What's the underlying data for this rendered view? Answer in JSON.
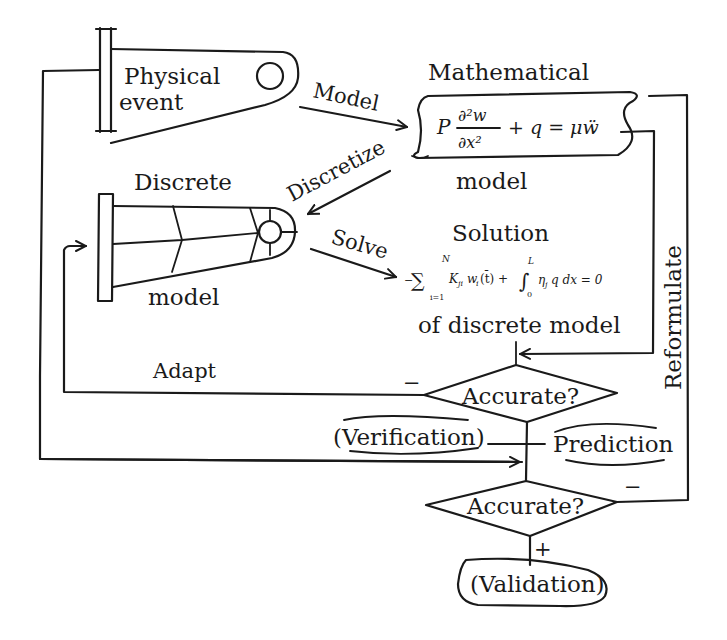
{
  "diagram": {
    "title": "",
    "nodes": {
      "physical_event": {
        "line1": "Physical",
        "line2": "event"
      },
      "mathematical_model": {
        "label_top": "Mathematical",
        "label_bottom": "model",
        "equation": {
          "P": "P",
          "num": "∂²w",
          "den": "∂x²",
          "rest": "+ q = μẅ"
        }
      },
      "discrete_model": {
        "label_top": "Discrete",
        "label_bottom": "model"
      },
      "solution": {
        "label_top": "Solution",
        "label_bottom": "of discrete  model",
        "equation": {
          "minus": "−",
          "sum": "∑",
          "sum_upper": "N",
          "sum_lower": "i=1",
          "term1": "K",
          "term1_sub": "ji",
          "term1b": "w",
          "term1b_sub": "i",
          "term1c": "(t̄) +",
          "integral": "∫",
          "int_upper": "L",
          "int_lower": "0",
          "term2": "η",
          "term2_sub": "j",
          "term2b": "q dx = 0"
        }
      },
      "decision_1": {
        "label": "Accurate?"
      },
      "decision_2": {
        "label": "Accurate?"
      },
      "verification": {
        "label": "(Verification)"
      },
      "prediction": {
        "label": "Prediction"
      },
      "validation": {
        "label": "(Validation)"
      }
    },
    "edges": {
      "model": "Model",
      "discretize": "Discretize",
      "solve": "Solve",
      "adapt": "Adapt",
      "reformulate": "Reformulate",
      "decision_1_no": "−",
      "decision_2_no": "−",
      "decision_2_yes": "+"
    },
    "colors": {
      "ink": "#1a1a1a",
      "background": "#ffffff"
    }
  }
}
